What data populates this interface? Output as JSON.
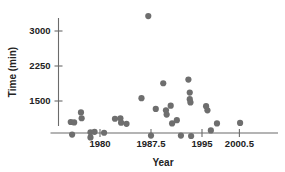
{
  "chart_data": {
    "type": "scatter",
    "title": "",
    "xlabel": "Year",
    "ylabel": "Time (min)",
    "xlim": [
      1975.2,
      2002.5
    ],
    "ylim": [
      600,
      3450
    ],
    "grid": false,
    "legend": null,
    "xticks": [
      1980,
      1987.5,
      1995,
      2000.5
    ],
    "xticklabels": [
      "1980",
      "1987.5",
      "1995",
      "2000.5"
    ],
    "yticks": [
      1500,
      2250,
      3000
    ],
    "yticklabels": [
      "1500",
      "2250",
      "3000"
    ],
    "marker": {
      "shape": "circle",
      "color": "#6e6e6e",
      "size": 3.1
    },
    "points": [
      {
        "x": 1975.7,
        "y": 1050
      },
      {
        "x": 1976.2,
        "y": 1040
      },
      {
        "x": 1975.9,
        "y": 780
      },
      {
        "x": 1977.2,
        "y": 1255
      },
      {
        "x": 1977.3,
        "y": 1130
      },
      {
        "x": 1978.6,
        "y": 830
      },
      {
        "x": 1978.6,
        "y": 720
      },
      {
        "x": 1979.2,
        "y": 840
      },
      {
        "x": 1980.6,
        "y": 820
      },
      {
        "x": 1982.2,
        "y": 1120
      },
      {
        "x": 1983.0,
        "y": 1130
      },
      {
        "x": 1983.1,
        "y": 1035
      },
      {
        "x": 1983.9,
        "y": 1010
      },
      {
        "x": 1986.1,
        "y": 1560
      },
      {
        "x": 1987.1,
        "y": 3320
      },
      {
        "x": 1987.5,
        "y": 760
      },
      {
        "x": 1988.2,
        "y": 1330
      },
      {
        "x": 1989.3,
        "y": 1880
      },
      {
        "x": 1989.7,
        "y": 1300
      },
      {
        "x": 1989.8,
        "y": 1210
      },
      {
        "x": 1990.4,
        "y": 1400
      },
      {
        "x": 1990.6,
        "y": 1020
      },
      {
        "x": 1991.3,
        "y": 1090
      },
      {
        "x": 1991.9,
        "y": 760
      },
      {
        "x": 1993.0,
        "y": 1960
      },
      {
        "x": 1993.2,
        "y": 1680
      },
      {
        "x": 1993.2,
        "y": 1540
      },
      {
        "x": 1993.3,
        "y": 1470
      },
      {
        "x": 1993.4,
        "y": 750
      },
      {
        "x": 1995.6,
        "y": 1390
      },
      {
        "x": 1995.8,
        "y": 1300
      },
      {
        "x": 1996.3,
        "y": 870
      },
      {
        "x": 1997.2,
        "y": 1020
      },
      {
        "x": 2000.6,
        "y": 1030
      }
    ]
  }
}
